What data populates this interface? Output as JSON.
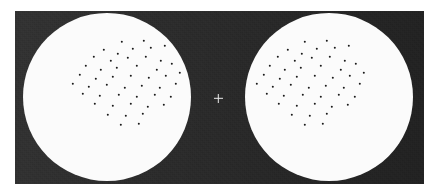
{
  "figure": {
    "background_color": "#ffffff",
    "surround_color": "#2b2b2b",
    "disc_color": "#fbfbfb",
    "dot_color": "#1a1a1a",
    "fixation_color": "#e9e9e9"
  },
  "surround": {
    "name": "dark-surround-panel",
    "x": 15,
    "y": 11,
    "width": 409,
    "height": 173
  },
  "fixation": {
    "name": "fixation-cross",
    "glyph": "+",
    "cx": 218,
    "cy": 98,
    "arm_length": 9,
    "thickness": 1.4
  },
  "discs": [
    {
      "id": "left-disc",
      "label": "Left eye aperture",
      "cx": 107,
      "cy": 97,
      "r": 84,
      "dot_count": 45,
      "cluster_offset": "up-right",
      "dots": [
        [
          122,
          42
        ],
        [
          144,
          41
        ],
        [
          104,
          50
        ],
        [
          118,
          54
        ],
        [
          133,
          49
        ],
        [
          151,
          48
        ],
        [
          165,
          46
        ],
        [
          94,
          57
        ],
        [
          111,
          61
        ],
        [
          128,
          58
        ],
        [
          146,
          57
        ],
        [
          161,
          61
        ],
        [
          86,
          66
        ],
        [
          101,
          70
        ],
        [
          117,
          68
        ],
        [
          137,
          66
        ],
        [
          157,
          70
        ],
        [
          172,
          64
        ],
        [
          80,
          75
        ],
        [
          96,
          79
        ],
        [
          113,
          77
        ],
        [
          131,
          76
        ],
        [
          149,
          78
        ],
        [
          166,
          76
        ],
        [
          180,
          73
        ],
        [
          73,
          84
        ],
        [
          89,
          87
        ],
        [
          107,
          85
        ],
        [
          125,
          88
        ],
        [
          142,
          86
        ],
        [
          160,
          88
        ],
        [
          176,
          84
        ],
        [
          83,
          94
        ],
        [
          100,
          96
        ],
        [
          119,
          95
        ],
        [
          137,
          97
        ],
        [
          155,
          95
        ],
        [
          171,
          97
        ],
        [
          95,
          104
        ],
        [
          113,
          106
        ],
        [
          131,
          104
        ],
        [
          148,
          107
        ],
        [
          164,
          105
        ],
        [
          108,
          115
        ],
        [
          126,
          116
        ],
        [
          143,
          114
        ],
        [
          121,
          125
        ],
        [
          139,
          124
        ]
      ]
    },
    {
      "id": "right-disc",
      "label": "Right eye aperture",
      "cx": 329,
      "cy": 97,
      "r": 84,
      "dot_count": 45,
      "cluster_offset": "up-left",
      "dots": [
        [
          305,
          42
        ],
        [
          327,
          41
        ],
        [
          288,
          50
        ],
        [
          302,
          54
        ],
        [
          317,
          49
        ],
        [
          335,
          48
        ],
        [
          349,
          46
        ],
        [
          278,
          57
        ],
        [
          295,
          61
        ],
        [
          312,
          58
        ],
        [
          330,
          57
        ],
        [
          345,
          61
        ],
        [
          270,
          66
        ],
        [
          285,
          70
        ],
        [
          301,
          68
        ],
        [
          321,
          66
        ],
        [
          341,
          70
        ],
        [
          356,
          64
        ],
        [
          264,
          75
        ],
        [
          280,
          79
        ],
        [
          297,
          77
        ],
        [
          315,
          76
        ],
        [
          333,
          78
        ],
        [
          350,
          76
        ],
        [
          364,
          73
        ],
        [
          257,
          84
        ],
        [
          273,
          87
        ],
        [
          291,
          85
        ],
        [
          309,
          88
        ],
        [
          326,
          86
        ],
        [
          344,
          88
        ],
        [
          360,
          84
        ],
        [
          267,
          94
        ],
        [
          284,
          96
        ],
        [
          303,
          95
        ],
        [
          321,
          97
        ],
        [
          339,
          95
        ],
        [
          355,
          97
        ],
        [
          279,
          104
        ],
        [
          297,
          106
        ],
        [
          315,
          104
        ],
        [
          332,
          107
        ],
        [
          348,
          105
        ],
        [
          292,
          115
        ],
        [
          310,
          116
        ],
        [
          327,
          114
        ],
        [
          305,
          125
        ],
        [
          323,
          124
        ]
      ]
    }
  ]
}
